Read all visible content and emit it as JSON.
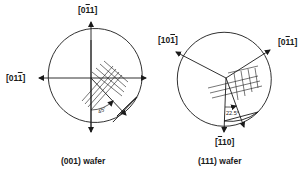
{
  "diagram": {
    "wafer_001": {
      "caption": "(001) wafer",
      "directions": {
        "top": {
          "pre": "[0",
          "bar": "1",
          "post": "1]"
        },
        "left": {
          "pre": "[01",
          "bar": "1",
          "post": "]"
        }
      },
      "angle_label": "45°",
      "angle_deg": 45
    },
    "wafer_111": {
      "caption": "(111) wafer",
      "directions": {
        "upper_left": {
          "pre": "[10",
          "bar": "1",
          "post": "]"
        },
        "upper_right": {
          "pre": "[0",
          "bar": "1",
          "post": "1]"
        },
        "bottom": {
          "pre": "[",
          "bar": "1",
          "post": "10]"
        }
      },
      "angle_label": "22.5°",
      "angle_deg": 22.5
    },
    "colors": {
      "line": "#1a1a1a",
      "background": "#ffffff"
    }
  }
}
